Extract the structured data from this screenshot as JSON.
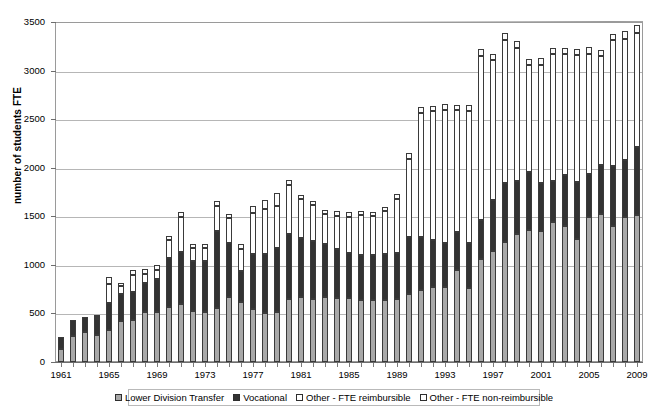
{
  "chart_data": {
    "type": "bar",
    "stacked": true,
    "title": "",
    "xlabel": "",
    "ylabel": "number of students FTE",
    "ylim": [
      0,
      3500
    ],
    "ytick_step": 500,
    "yticks": [
      0,
      500,
      1000,
      1500,
      2000,
      2500,
      3000,
      3500
    ],
    "grid": true,
    "legend_position": "bottom",
    "xtick_labels": [
      "1961",
      "1965",
      "1969",
      "1973",
      "1977",
      "1981",
      "1985",
      "1989",
      "1993",
      "1997",
      "2001",
      "2005",
      "2009"
    ],
    "xtick_interval": 4,
    "categories": [
      "1961",
      "1962",
      "1963",
      "1964",
      "1965",
      "1966",
      "1967",
      "1968",
      "1969",
      "1970",
      "1971",
      "1972",
      "1973",
      "1974",
      "1975",
      "1976",
      "1977",
      "1978",
      "1979",
      "1980",
      "1981",
      "1982",
      "1983",
      "1984",
      "1985",
      "1986",
      "1987",
      "1988",
      "1989",
      "1990",
      "1991",
      "1992",
      "1993",
      "1994",
      "1995",
      "1996",
      "1997",
      "1998",
      "1999",
      "2000",
      "2001",
      "2002",
      "2003",
      "2004",
      "2005",
      "2006",
      "2007",
      "2008",
      "2009"
    ],
    "series": [
      {
        "name": "Lower Division Transfer",
        "color": "#a8a8a8",
        "values": [
          130,
          265,
          305,
          275,
          330,
          420,
          430,
          510,
          515,
          570,
          600,
          525,
          510,
          560,
          670,
          615,
          545,
          505,
          520,
          650,
          665,
          650,
          665,
          655,
          660,
          640,
          640,
          635,
          645,
          700,
          745,
          775,
          770,
          950,
          760,
          1060,
          1145,
          1240,
          1320,
          1360,
          1345,
          1440,
          1405,
          1265,
          1490,
          1520,
          1405,
          1490,
          1510
        ]
      },
      {
        "name": "Vocational",
        "color": "#333333",
        "values": [
          130,
          165,
          160,
          170,
          275,
          280,
          290,
          300,
          340,
          505,
          535,
          520,
          530,
          790,
          555,
          320,
          570,
          610,
          655,
          670,
          615,
          595,
          555,
          505,
          460,
          460,
          465,
          480,
          480,
          585,
          540,
          485,
          455,
          390,
          465,
          405,
          520,
          600,
          540,
          595,
          500,
          420,
          525,
          585,
          450,
          510,
          615,
          590,
          700
        ]
      },
      {
        "name": "Other - FTE reimbursible",
        "color": "#ffffff",
        "values": [
          0,
          0,
          0,
          20,
          195,
          85,
          175,
          100,
          95,
          180,
          355,
          130,
          130,
          255,
          255,
          225,
          420,
          460,
          430,
          500,
          395,
          375,
          300,
          345,
          375,
          410,
          400,
          435,
          555,
          810,
          1280,
          1320,
          1370,
          1250,
          1360,
          1690,
          1440,
          1475,
          1370,
          1100,
          1215,
          1310,
          1240,
          1310,
          1230,
          1120,
          1290,
          1250,
          1180
        ]
      },
      {
        "name": "Other - FTE non-reimbursible",
        "color": "#ffffff",
        "values": [
          0,
          0,
          0,
          20,
          80,
          25,
          50,
          45,
          50,
          45,
          55,
          35,
          45,
          55,
          45,
          50,
          70,
          95,
          130,
          55,
          40,
          40,
          40,
          45,
          45,
          45,
          40,
          45,
          50,
          55,
          65,
          60,
          65,
          60,
          65,
          65,
          65,
          70,
          70,
          65,
          65,
          65,
          65,
          65,
          70,
          65,
          70,
          80,
          80
        ]
      }
    ]
  },
  "legend": {
    "items": [
      {
        "label": "Lower Division Transfer"
      },
      {
        "label": "Vocational"
      },
      {
        "label": "Other - FTE reimbursible"
      },
      {
        "label": "Other - FTE non-reimbursible"
      }
    ]
  }
}
